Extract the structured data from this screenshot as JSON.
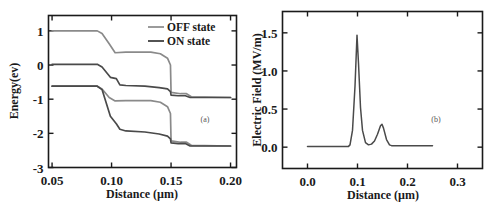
{
  "figure": {
    "background_color": "#ffffff",
    "line_color_off": "#8a8a8a",
    "line_color_on": "#4a4a4a",
    "axis_color": "#1a1a1a"
  },
  "panel_a": {
    "tag": "(a)",
    "legend": {
      "items": [
        {
          "label": "OFF state",
          "color": "#8a8a8a"
        },
        {
          "label": "ON state",
          "color": "#4a4a4a"
        }
      ]
    }
  },
  "panel_b": {
    "tag": "(b)"
  },
  "chart_data": [
    {
      "type": "line",
      "id": "panel-a",
      "title": "",
      "tag": "(a)",
      "xlabel": "Distance (µm)",
      "ylabel": "Energy(ev)",
      "xlim": [
        0.047,
        0.205
      ],
      "ylim": [
        -3,
        1.45
      ],
      "xticks": [
        0.05,
        0.1,
        0.15,
        0.2
      ],
      "xtick_labels": [
        "0.05",
        "0.10",
        "0.15",
        "0.20"
      ],
      "yticks": [
        1,
        0,
        -1,
        -2,
        -3
      ],
      "ytick_labels": [
        "1",
        "0",
        "-1",
        "-2",
        "-3"
      ],
      "grid": false,
      "legend_position": "upper right",
      "series": [
        {
          "name": "OFF state conduction band",
          "legend": "OFF state",
          "color": "#8a8a8a",
          "x": [
            0.05,
            0.088,
            0.092,
            0.098,
            0.103,
            0.112,
            0.133,
            0.141,
            0.147,
            0.1495,
            0.15,
            0.158,
            0.163,
            0.167,
            0.2
          ],
          "y": [
            1.0,
            1.0,
            0.92,
            0.62,
            0.36,
            0.38,
            0.38,
            0.33,
            0.2,
            0.0,
            -0.8,
            -0.84,
            -0.84,
            -0.93,
            -0.95
          ]
        },
        {
          "name": "ON state conduction band",
          "legend": "ON state",
          "color": "#4a4a4a",
          "x": [
            0.05,
            0.088,
            0.092,
            0.099,
            0.104,
            0.107,
            0.112,
            0.128,
            0.14,
            0.147,
            0.1495,
            0.15,
            0.156,
            0.162,
            0.166,
            0.2
          ],
          "y": [
            0.02,
            0.02,
            -0.06,
            -0.36,
            -0.4,
            -0.58,
            -0.6,
            -0.62,
            -0.66,
            -0.7,
            -0.78,
            -0.88,
            -0.9,
            -0.9,
            -0.95,
            -0.95
          ]
        },
        {
          "name": "OFF state valence band",
          "legend": "OFF state",
          "color": "#8a8a8a",
          "x": [
            0.05,
            0.088,
            0.092,
            0.098,
            0.103,
            0.112,
            0.133,
            0.141,
            0.147,
            0.1495,
            0.15,
            0.158,
            0.163,
            0.167,
            0.2
          ],
          "y": [
            -0.62,
            -0.62,
            -0.7,
            -0.95,
            -1.05,
            -1.04,
            -1.04,
            -1.09,
            -1.22,
            -1.42,
            -2.22,
            -2.26,
            -2.26,
            -2.35,
            -2.37
          ]
        },
        {
          "name": "ON state valence band",
          "legend": "ON state",
          "color": "#4a4a4a",
          "x": [
            0.05,
            0.088,
            0.092,
            0.099,
            0.104,
            0.107,
            0.112,
            0.128,
            0.14,
            0.147,
            0.1495,
            0.15,
            0.156,
            0.162,
            0.166,
            0.2
          ],
          "y": [
            -0.62,
            -0.62,
            -0.72,
            -1.5,
            -1.72,
            -1.88,
            -1.93,
            -1.96,
            -2.02,
            -2.08,
            -2.16,
            -2.28,
            -2.3,
            -2.3,
            -2.37,
            -2.37
          ]
        }
      ]
    },
    {
      "type": "line",
      "id": "panel-b",
      "title": "",
      "tag": "(b)",
      "xlabel": "Distance (µm)",
      "ylabel": "Electric Field (MV/m)",
      "xlim": [
        -0.05,
        0.35
      ],
      "ylim": [
        -0.28,
        1.78
      ],
      "xticks": [
        0.0,
        0.1,
        0.2,
        0.3
      ],
      "xtick_labels": [
        "0.0",
        "0.1",
        "0.2",
        "0.3"
      ],
      "yticks": [
        0.0,
        0.5,
        1.0,
        1.5
      ],
      "ytick_labels": [
        "0.0",
        "0.5",
        "1.0",
        "1.5"
      ],
      "grid": false,
      "legend_position": "none",
      "series": [
        {
          "name": "Electric field",
          "color": "#4a4a4a",
          "x": [
            0.0,
            0.04,
            0.07,
            0.082,
            0.085,
            0.09,
            0.095,
            0.099,
            0.102,
            0.106,
            0.11,
            0.116,
            0.122,
            0.128,
            0.134,
            0.14,
            0.146,
            0.149,
            0.152,
            0.158,
            0.164,
            0.168,
            0.2,
            0.25
          ],
          "y": [
            0.01,
            0.01,
            0.01,
            0.01,
            0.03,
            0.22,
            0.8,
            1.47,
            1.1,
            0.52,
            0.22,
            0.06,
            0.03,
            0.04,
            0.08,
            0.17,
            0.28,
            0.3,
            0.25,
            0.1,
            0.03,
            0.02,
            0.02,
            0.02
          ]
        }
      ]
    }
  ]
}
